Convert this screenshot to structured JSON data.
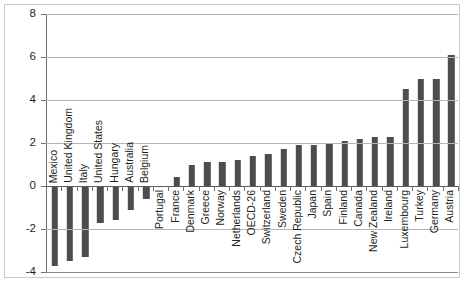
{
  "chart_data": {
    "type": "bar",
    "title": "",
    "subtitle": "",
    "xlabel": "",
    "ylabel": "",
    "ylim": [
      -4,
      8
    ],
    "yticks": [
      -4,
      -2,
      0,
      2,
      4,
      6,
      8
    ],
    "ytick_labels": [
      "-4",
      "-2",
      "0",
      "2",
      "4",
      "6",
      "8"
    ],
    "grid": true,
    "legend": false,
    "legend_position": "none",
    "bar_color": "#4d4d4d",
    "categories": [
      "Mexico",
      "United Kingdom",
      "Italy",
      "United States",
      "Hungary",
      "Australia",
      "Belgium",
      "Portugal",
      "France",
      "Denmark",
      "Greece",
      "Norway",
      "Netherlands",
      "OECD-26",
      "Switzerland",
      "Sweden",
      "Czech Republic",
      "Japan",
      "Spain",
      "Finland",
      "Canada",
      "New Zealand",
      "Ireland",
      "Luxembourg",
      "Turkey",
      "Germany",
      "Austria"
    ],
    "values": [
      -3.7,
      -3.5,
      -3.3,
      -1.7,
      -1.6,
      -1.1,
      -0.6,
      0.0,
      0.4,
      1.0,
      1.1,
      1.1,
      1.2,
      1.4,
      1.5,
      1.7,
      1.9,
      1.9,
      2.0,
      2.1,
      2.2,
      2.3,
      2.3,
      4.5,
      5.0,
      5.0,
      6.1
    ]
  }
}
